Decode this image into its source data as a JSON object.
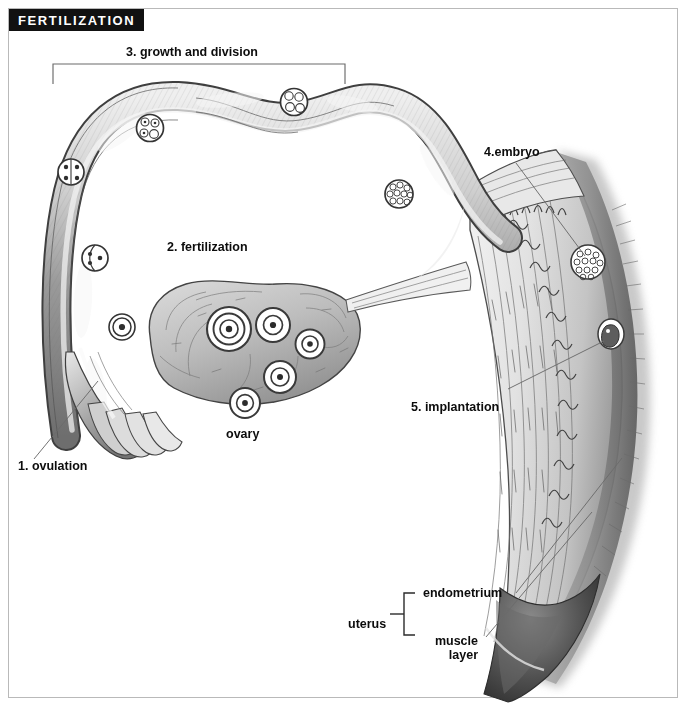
{
  "figure": {
    "title": "FERTILIZATION",
    "type": "anatomical-diagram",
    "background_color": "#ffffff",
    "frame_color": "#b9b9b9",
    "banner_background": "#111111",
    "banner_text_color": "#ffffff",
    "ink_color": "#3a3a3a",
    "tissue_fill": "#c9c9c9"
  },
  "labels": {
    "step1": "1. ovulation",
    "step2": "2. fertilization",
    "step3": "3. growth and division",
    "step4": "4.embryo",
    "step5": "5. implantation",
    "ovary": "ovary",
    "uterus": "uterus",
    "endometrium": "endometrium",
    "muscle_layer_line1": "muscle",
    "muscle_layer_line2": "layer"
  },
  "numbered_steps": [
    {
      "number": "1",
      "label": "1. ovulation",
      "leader": true,
      "bracket": false
    },
    {
      "number": "2",
      "label": "2. fertilization",
      "leader": false,
      "bracket": false
    },
    {
      "number": "3",
      "label": "3. growth and division",
      "leader": false,
      "bracket": true
    },
    {
      "number": "4",
      "label": "4.embryo",
      "leader": true,
      "bracket": false
    },
    {
      "number": "5",
      "label": "5. implantation",
      "leader": true,
      "bracket": false
    }
  ],
  "anatomy_labels": [
    {
      "name": "ovary",
      "label": "ovary",
      "leader": false,
      "bracket": false
    },
    {
      "name": "uterus",
      "label": "uterus",
      "leader": false,
      "bracket": true
    },
    {
      "name": "endometrium",
      "label": "endometrium",
      "leader": true,
      "bracket": false
    },
    {
      "name": "muscle-layer",
      "label": "muscle layer",
      "leader": true,
      "bracket": false
    }
  ],
  "ovary_follicles": [
    {
      "stage": "mature follicle",
      "rings": 3
    },
    {
      "stage": "developing follicle",
      "rings": 2
    },
    {
      "stage": "developing follicle",
      "rings": 2
    },
    {
      "stage": "developing follicle",
      "rings": 2
    },
    {
      "stage": "developing follicle",
      "rings": 2
    }
  ],
  "tube_cell_stages": [
    {
      "stage": "ovum",
      "cells": 1
    },
    {
      "stage": "2-cell",
      "cells": 2
    },
    {
      "stage": "4-cell",
      "cells": 4
    },
    {
      "stage": "8-cell",
      "cells": 8
    },
    {
      "stage": "morula",
      "cells": 16
    }
  ]
}
